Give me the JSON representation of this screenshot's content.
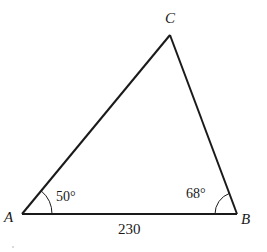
{
  "diagram": {
    "type": "triangle",
    "vertices": {
      "A": {
        "label": "A"
      },
      "B": {
        "label": "B"
      },
      "C": {
        "label": "C"
      }
    },
    "angles": {
      "A": "50°",
      "B": "68°"
    },
    "sides": {
      "AB": "230"
    },
    "colors": {
      "stroke": "#1a1a1a",
      "background": "#ffffff"
    }
  }
}
